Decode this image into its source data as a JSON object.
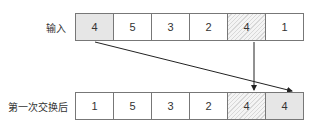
{
  "rows": [
    {
      "label": "输入",
      "cells": [
        {
          "value": "4",
          "style": "shaded"
        },
        {
          "value": "5",
          "style": "plain"
        },
        {
          "value": "3",
          "style": "plain"
        },
        {
          "value": "2",
          "style": "plain"
        },
        {
          "value": "4",
          "style": "hatched"
        },
        {
          "value": "1",
          "style": "plain"
        }
      ]
    },
    {
      "label": "第一次交换后",
      "cells": [
        {
          "value": "1",
          "style": "plain"
        },
        {
          "value": "5",
          "style": "plain"
        },
        {
          "value": "3",
          "style": "plain"
        },
        {
          "value": "2",
          "style": "plain"
        },
        {
          "value": "4",
          "style": "hatched"
        },
        {
          "value": "4",
          "style": "shaded"
        }
      ]
    }
  ],
  "arrows": [
    {
      "from": "rows.0.cells.0",
      "to": "rows.1.cells.5"
    },
    {
      "from": "rows.0.cells.4",
      "to": "rows.1.cells.4"
    }
  ],
  "colors": {
    "line": "#222222",
    "border": "#777777",
    "shaded": "#e6e6e6"
  }
}
